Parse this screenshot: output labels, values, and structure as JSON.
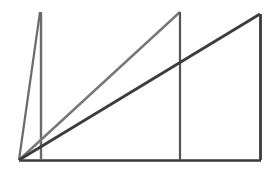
{
  "figure": {
    "width": 278,
    "height": 173,
    "background_color": "#ffffff",
    "origin_point": {
      "x": 19,
      "y": 160
    },
    "colors": {
      "baseline": "#3a3a3a",
      "narrow_triangle": "#6b6b6b",
      "middle_triangle": "#777777",
      "right_triangle": "#3c3c3c",
      "vertical_middle": "#555555",
      "vertical_right": "#3c3c3c",
      "vertical_narrow": "#6b6b6b"
    },
    "shapes": [
      {
        "name": "baseline",
        "kind": "line",
        "color": "#3a3a3a",
        "width": 2.6,
        "points": [
          {
            "x": 19,
            "y": 160.5
          },
          {
            "x": 261,
            "y": 160.5
          }
        ]
      },
      {
        "name": "narrow-triangle-hypotenuse",
        "kind": "line",
        "color": "#6b6b6b",
        "width": 2.2,
        "points": [
          {
            "x": 19,
            "y": 160
          },
          {
            "x": 40,
            "y": 12
          }
        ]
      },
      {
        "name": "narrow-triangle-vertical",
        "kind": "line",
        "color": "#6b6b6b",
        "width": 2.4,
        "points": [
          {
            "x": 41,
            "y": 12
          },
          {
            "x": 41,
            "y": 160
          }
        ]
      },
      {
        "name": "middle-triangle-hypotenuse",
        "kind": "line",
        "color": "#777777",
        "width": 2.4,
        "points": [
          {
            "x": 19,
            "y": 160
          },
          {
            "x": 180,
            "y": 12
          }
        ]
      },
      {
        "name": "middle-triangle-vertical",
        "kind": "line",
        "color": "#555555",
        "width": 2.2,
        "points": [
          {
            "x": 180,
            "y": 12
          },
          {
            "x": 180,
            "y": 160
          }
        ]
      },
      {
        "name": "right-triangle-hypotenuse",
        "kind": "line",
        "color": "#3c3c3c",
        "width": 2.8,
        "points": [
          {
            "x": 19,
            "y": 160
          },
          {
            "x": 260,
            "y": 14
          }
        ]
      },
      {
        "name": "right-triangle-vertical",
        "kind": "line",
        "color": "#3c3c3c",
        "width": 2.8,
        "points": [
          {
            "x": 260.5,
            "y": 14
          },
          {
            "x": 260.5,
            "y": 160
          }
        ]
      }
    ],
    "intersections": [
      {
        "name": "dark-diagonal-crosses-middle-vertical",
        "x": 180,
        "y": 68
      }
    ]
  }
}
